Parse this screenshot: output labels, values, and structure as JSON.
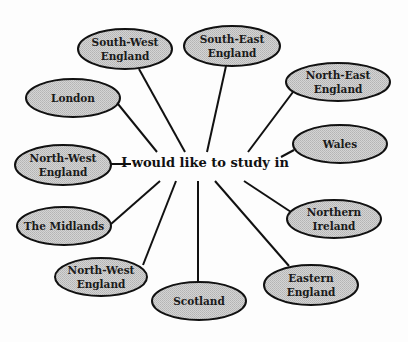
{
  "diagram": {
    "type": "spider-diagram",
    "center": {
      "label": "I would like to study in"
    },
    "colors": {
      "ellipse_fill": "#c6c6c6",
      "ellipse_stroke": "#111111",
      "line": "#111111",
      "text": "#1a1a1a",
      "background": "#fdfdfd"
    },
    "nodes": [
      {
        "id": "south-west-england",
        "lines": [
          "South-West",
          "England"
        ]
      },
      {
        "id": "south-east-england",
        "lines": [
          "South-East",
          "England"
        ]
      },
      {
        "id": "london",
        "lines": [
          "London"
        ]
      },
      {
        "id": "north-east-england",
        "lines": [
          "North-East",
          "England"
        ]
      },
      {
        "id": "north-west-england-left",
        "lines": [
          "North-West",
          "England"
        ]
      },
      {
        "id": "wales",
        "lines": [
          "Wales"
        ]
      },
      {
        "id": "the-midlands",
        "lines": [
          "The Midlands"
        ]
      },
      {
        "id": "northern-ireland",
        "lines": [
          "Northern",
          "Ireland"
        ]
      },
      {
        "id": "north-west-england-bottom",
        "lines": [
          "North-West",
          "England"
        ]
      },
      {
        "id": "eastern-england",
        "lines": [
          "Eastern",
          "England"
        ]
      },
      {
        "id": "scotland",
        "lines": [
          "Scotland"
        ]
      }
    ]
  }
}
